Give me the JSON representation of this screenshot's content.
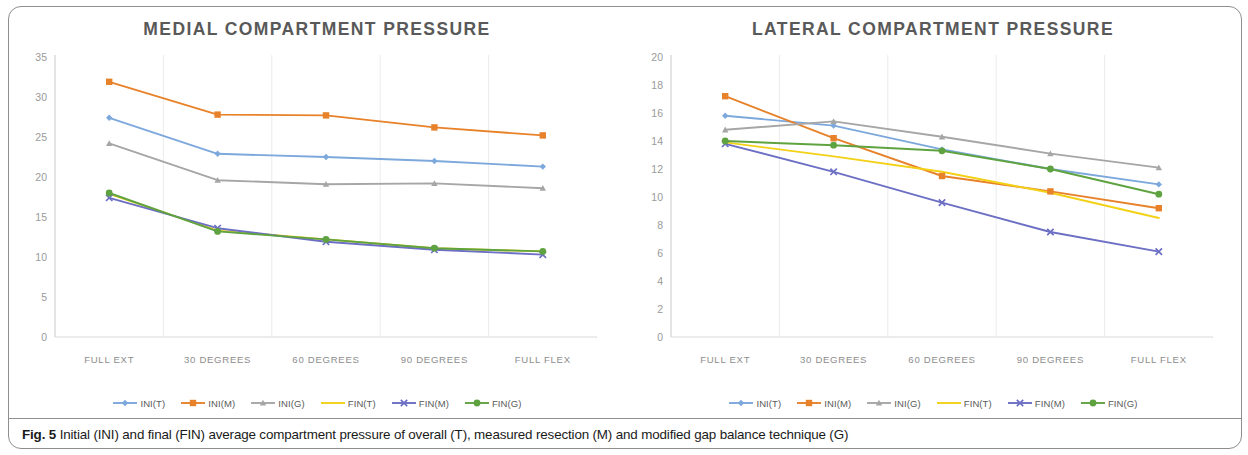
{
  "figure": {
    "caption_prefix": "Fig. 5",
    "caption_text": "Initial (INI) and final (FIN) average compartment pressure of overall (T), measured resection (M) and modified gap balance technique (G)"
  },
  "series_colors": {
    "INI(T)": "#7CA8DC",
    "INI(M)": "#E8822A",
    "INI(G)": "#A6A6A6",
    "FIN(T)": "#F2D117",
    "FIN(M)": "#6C6FC4",
    "FIN(G)": "#5FA340"
  },
  "legend": {
    "items": [
      {
        "label": "INI(T)",
        "color": "#7CA8DC",
        "marker": "diamond"
      },
      {
        "label": "INI(M)",
        "color": "#E8822A",
        "marker": "square"
      },
      {
        "label": "INI(G)",
        "color": "#A6A6A6",
        "marker": "triangle"
      },
      {
        "label": "FIN(T)",
        "color": "#F2D117",
        "marker": "line"
      },
      {
        "label": "FIN(M)",
        "color": "#6C6FC4",
        "marker": "cross"
      },
      {
        "label": "FIN(G)",
        "color": "#5FA340",
        "marker": "circle"
      }
    ]
  },
  "chart_data": [
    {
      "type": "line",
      "title": "MEDIAL COMPARTMENT PRESSURE",
      "xlabel": "",
      "ylabel": "",
      "ylim": [
        0,
        35
      ],
      "yticks": [
        0,
        5,
        10,
        15,
        20,
        25,
        30,
        35
      ],
      "grid": "vertical",
      "legend_position": "bottom",
      "categories": [
        "FULL EXT",
        "30 DEGREES",
        "60 DEGREES",
        "90 DEGREES",
        "FULL FLEX"
      ],
      "series": [
        {
          "name": "INI(T)",
          "color": "#7CA8DC",
          "marker": "diamond",
          "values": [
            27.4,
            22.9,
            22.5,
            22.0,
            21.3
          ]
        },
        {
          "name": "INI(M)",
          "color": "#E8822A",
          "marker": "square",
          "values": [
            31.9,
            27.8,
            27.7,
            26.2,
            25.2
          ]
        },
        {
          "name": "INI(G)",
          "color": "#A6A6A6",
          "marker": "triangle",
          "values": [
            24.2,
            19.6,
            19.1,
            19.2,
            18.6
          ]
        },
        {
          "name": "FIN(T)",
          "color": "#F2D117",
          "marker": "none",
          "values": [
            17.9,
            13.3,
            12.2,
            11.1,
            10.7
          ]
        },
        {
          "name": "FIN(M)",
          "color": "#6C6FC4",
          "marker": "cross",
          "values": [
            17.4,
            13.6,
            11.9,
            10.9,
            10.3
          ]
        },
        {
          "name": "FIN(G)",
          "color": "#5FA340",
          "marker": "circle",
          "values": [
            18.0,
            13.2,
            12.2,
            11.1,
            10.7
          ]
        }
      ]
    },
    {
      "type": "line",
      "title": "LATERAL COMPARTMENT PRESSURE",
      "xlabel": "",
      "ylabel": "",
      "ylim": [
        0,
        20
      ],
      "yticks": [
        0,
        2,
        4,
        6,
        8,
        10,
        12,
        14,
        16,
        18,
        20
      ],
      "grid": "vertical",
      "legend_position": "bottom",
      "categories": [
        "FULL EXT",
        "30 DEGREES",
        "60 DEGREES",
        "90 DEGREES",
        "FULL FLEX"
      ],
      "series": [
        {
          "name": "INI(T)",
          "color": "#7CA8DC",
          "marker": "diamond",
          "values": [
            15.8,
            15.1,
            13.4,
            12.0,
            10.9
          ]
        },
        {
          "name": "INI(M)",
          "color": "#E8822A",
          "marker": "square",
          "values": [
            17.2,
            14.2,
            11.5,
            10.4,
            9.2
          ]
        },
        {
          "name": "INI(G)",
          "color": "#A6A6A6",
          "marker": "triangle",
          "values": [
            14.8,
            15.4,
            14.3,
            13.1,
            12.1
          ]
        },
        {
          "name": "FIN(T)",
          "color": "#F2D117",
          "marker": "none",
          "values": [
            13.9,
            12.9,
            11.8,
            10.3,
            8.5
          ]
        },
        {
          "name": "FIN(M)",
          "color": "#6C6FC4",
          "marker": "cross",
          "values": [
            13.8,
            11.8,
            9.6,
            7.5,
            6.1
          ]
        },
        {
          "name": "FIN(G)",
          "color": "#5FA340",
          "marker": "circle",
          "values": [
            14.0,
            13.7,
            13.3,
            12.0,
            10.2
          ]
        }
      ]
    }
  ]
}
